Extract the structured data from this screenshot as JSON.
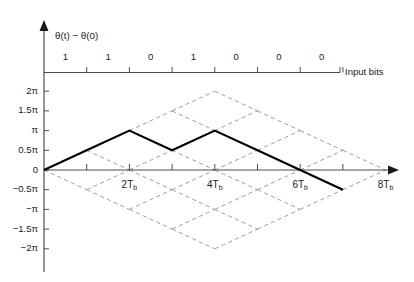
{
  "figure": {
    "kind": "phase-trellis-diagram",
    "background_color": "#ffffff",
    "line_color": "#000000",
    "dashed_color": "#8c8c8c",
    "axis_color": "#4d4d4d"
  },
  "chart_data": {
    "type": "line",
    "title": "",
    "ylabel": "θ(t) − θ(0)",
    "xlabel": "",
    "bits_axis_label": "Input bits",
    "grid": false,
    "legend": null,
    "xlim": [
      0,
      8
    ],
    "ylim": [
      -2,
      2
    ],
    "x_unit": "Tb",
    "y_unit": "π",
    "x_ticks": [
      0,
      1,
      2,
      3,
      4,
      5,
      6,
      7,
      8
    ],
    "x_tick_labels": [
      "",
      "",
      "2T",
      "",
      "4T",
      "",
      "6T",
      "",
      "8T"
    ],
    "x_labeled": [
      {
        "x": 2,
        "text": "2T",
        "sub": "b"
      },
      {
        "x": 4,
        "text": "4T",
        "sub": "b"
      },
      {
        "x": 6,
        "text": "6T",
        "sub": "b"
      },
      {
        "x": 8,
        "text": "8T",
        "sub": "b"
      }
    ],
    "y_ticks": [
      2,
      1.5,
      1,
      0.5,
      0,
      -0.5,
      -1,
      -1.5,
      -2
    ],
    "y_tick_labels": [
      "2π",
      "1.5π",
      "π",
      "0.5π",
      "0",
      "−0.5π",
      "−π",
      "−1.5π",
      "−2π"
    ],
    "input_bits": [
      "1",
      "1",
      "0",
      "1",
      "0",
      "0",
      "0"
    ],
    "bit_tick_count": 8,
    "series": [
      {
        "name": "phase trajectory",
        "style": "solid-bold",
        "x": [
          0,
          1,
          2,
          3,
          4,
          5,
          6,
          7
        ],
        "values": [
          0,
          0.5,
          1,
          0.5,
          1,
          0.5,
          0,
          -0.5
        ]
      }
    ],
    "trellis_slope_per_bit": 0.5,
    "trellis_dashed_description": "full phase tree lattice, slopes ±0.5π per Tb, converging envelope to 8Tb"
  }
}
